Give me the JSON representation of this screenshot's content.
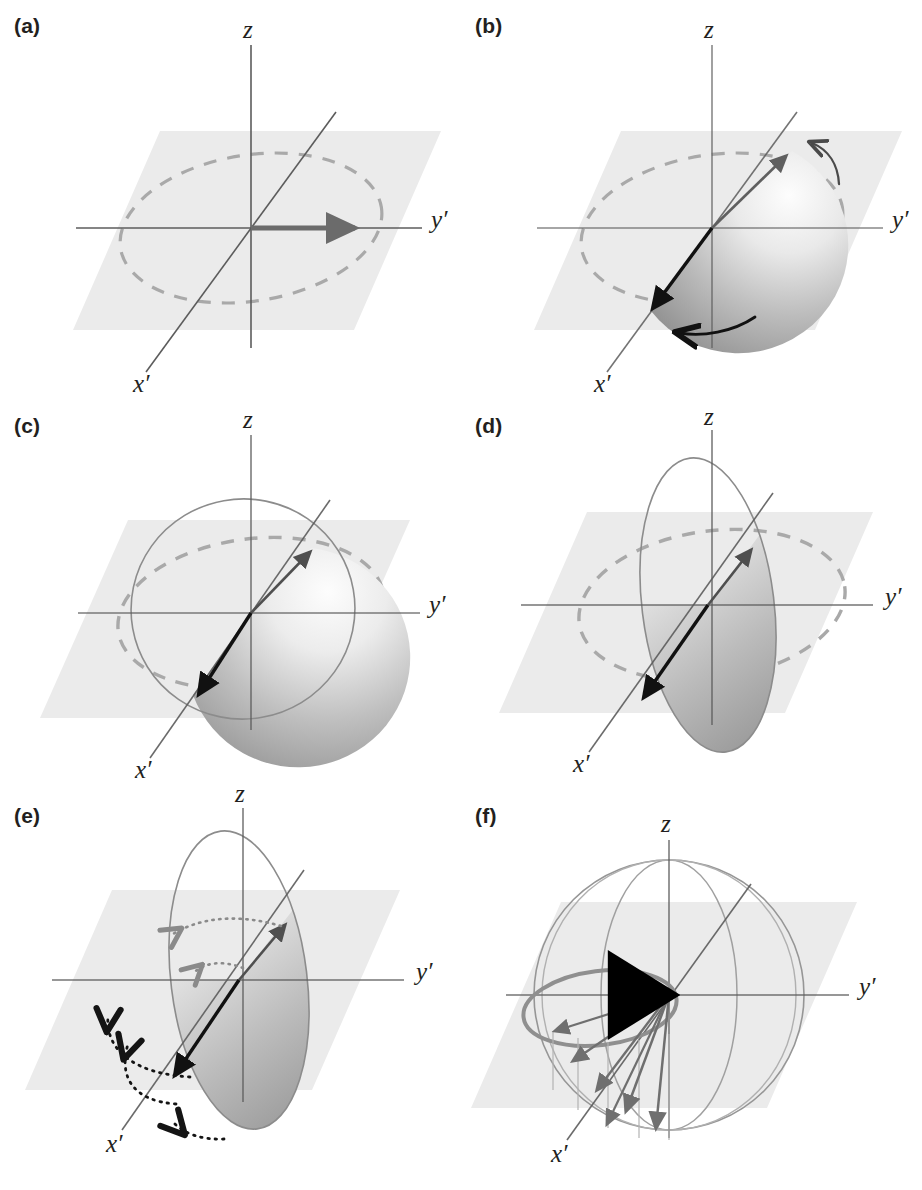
{
  "figure": {
    "type": "scientific-diagram",
    "panel_count": 6,
    "background_color": "#ffffff",
    "colors": {
      "plane_fill": "#ebebeb",
      "dashed_circle": "#a9a9a9",
      "axis_line": "#5c5c5c",
      "thin_outline": "#8c8c8c",
      "gray_arrow": "#6b6b6b",
      "black_arrow": "#1a1a1a",
      "gradient_light": "#fbfbfb",
      "gradient_dark": "#8f8f8f",
      "label_text": "#231f20"
    }
  },
  "panels": [
    {
      "id": "a",
      "label": "(a)",
      "axes": {
        "z": "z",
        "y": "y′",
        "x": "x′"
      },
      "elements": {
        "plane": true,
        "dashed_circle": true,
        "outline_ellipse": false,
        "fan": false,
        "gray_vector": true,
        "black_vector": false,
        "curved_arrows": 0,
        "dotted_arrows": 0,
        "sphere": false
      },
      "caption_note": "Magnetization vector along y′"
    },
    {
      "id": "b",
      "label": "(b)",
      "axes": {
        "z": "z",
        "y": "y′",
        "x": "x′"
      },
      "elements": {
        "plane": true,
        "dashed_circle": true,
        "outline_ellipse": false,
        "fan": true,
        "gray_vector": true,
        "black_vector": true,
        "curved_arrows": 2,
        "dotted_arrows": 0,
        "sphere": false
      },
      "fan_spread_deg": 200,
      "caption_note": "Dephasing fan begins to spread"
    },
    {
      "id": "c",
      "label": "(c)",
      "axes": {
        "z": "z",
        "y": "y′",
        "x": "x′"
      },
      "elements": {
        "plane": true,
        "dashed_circle": true,
        "outline_ellipse": true,
        "fan": true,
        "gray_vector": true,
        "black_vector": true,
        "curved_arrows": 0,
        "dotted_arrows": 0,
        "sphere": false
      },
      "fan_spread_deg": 160,
      "caption_note": "Fan narrows, circle outline appears"
    },
    {
      "id": "d",
      "label": "(d)",
      "axes": {
        "z": "z",
        "y": "y′",
        "x": "x′"
      },
      "elements": {
        "plane": true,
        "dashed_circle": true,
        "outline_ellipse": true,
        "fan": true,
        "gray_vector": true,
        "black_vector": true,
        "curved_arrows": 0,
        "dotted_arrows": 0,
        "sphere": false
      },
      "fan_spread_deg": 120,
      "caption_note": "Narrow ellipse, vectors nearly collinear"
    },
    {
      "id": "e",
      "label": "(e)",
      "axes": {
        "z": "z",
        "y": "y′",
        "x": "x′"
      },
      "elements": {
        "plane": true,
        "dashed_circle": false,
        "outline_ellipse": true,
        "fan": true,
        "gray_vector": true,
        "black_vector": true,
        "curved_arrows": 0,
        "dotted_arrows": 5,
        "sphere": false
      },
      "fan_spread_deg": 120,
      "caption_note": "Dotted arrows indicate refocusing motion"
    },
    {
      "id": "f",
      "label": "(f)",
      "axes": {
        "z": "z",
        "y": "y′",
        "x": "x′"
      },
      "elements": {
        "plane": true,
        "dashed_circle": false,
        "outline_ellipse": false,
        "fan": false,
        "gray_vector": false,
        "black_vector": true,
        "curved_arrows": 0,
        "dotted_arrows": 0,
        "sphere": true,
        "ring_ellipse": true,
        "radiating_arrows": 6
      },
      "caption_note": "Refocused vector along −y′ with sphere and spread cone"
    }
  ]
}
